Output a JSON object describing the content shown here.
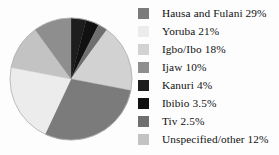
{
  "chart_data": {
    "type": "pie",
    "title": "",
    "subtitle": "",
    "xlabel": "",
    "ylabel": "",
    "legend_position": "right",
    "grid": false,
    "start_angle_deg": 0,
    "direction": "clockwise",
    "categories": [
      "Hausa and Fulani",
      "Yoruba",
      "Igbo/Ibo",
      "Ijaw",
      "Kanuri",
      "Ibibio",
      "Tiv",
      "Unspecified/other"
    ],
    "values": [
      29,
      21,
      18,
      10,
      4,
      3.5,
      2.5,
      12
    ],
    "value_suffix": "%",
    "colors": [
      "#7b7b7b",
      "#ececec",
      "#d2d2d2",
      "#8e8e8e",
      "#1d1d1d",
      "#111111",
      "#6f6f6f",
      "#c3c3c3"
    ],
    "labels": [
      "Hausa and Fulani 29%",
      "Yoruba 21%",
      "Igbo/Ibo 18%",
      "Ijaw 10%",
      "Kanuri 4%",
      "Ibibio 3.5%",
      "Tiv 2.5%",
      "Unspecified/other 12%"
    ]
  },
  "pie": {
    "center_x": 63,
    "center_y": 65,
    "radius": 61,
    "outline_color": "#b8b8b8",
    "slice_order_from_top_clockwise": [
      "Kanuri",
      "Ibibio",
      "Tiv",
      "Igbo/Ibo",
      "Hausa and Fulani",
      "Yoruba",
      "Unspecified/other",
      "Ijaw"
    ]
  },
  "legend": {
    "items": [
      {
        "label": "Hausa and Fulani 29%",
        "color": "#7b7b7b",
        "name": "hausa-and-fulani"
      },
      {
        "label": "Yoruba 21%",
        "color": "#ececec",
        "name": "yoruba"
      },
      {
        "label": "Igbo/Ibo 18%",
        "color": "#d2d2d2",
        "name": "igbo-ibo"
      },
      {
        "label": "Ijaw 10%",
        "color": "#8e8e8e",
        "name": "ijaw"
      },
      {
        "label": "Kanuri 4%",
        "color": "#1d1d1d",
        "name": "kanuri"
      },
      {
        "label": "Ibibio 3.5%",
        "color": "#111111",
        "name": "ibibio"
      },
      {
        "label": "Tiv 2.5%",
        "color": "#6f6f6f",
        "name": "tiv"
      },
      {
        "label": "Unspecified/other 12%",
        "color": "#c3c3c3",
        "name": "unspecified-other"
      }
    ]
  }
}
